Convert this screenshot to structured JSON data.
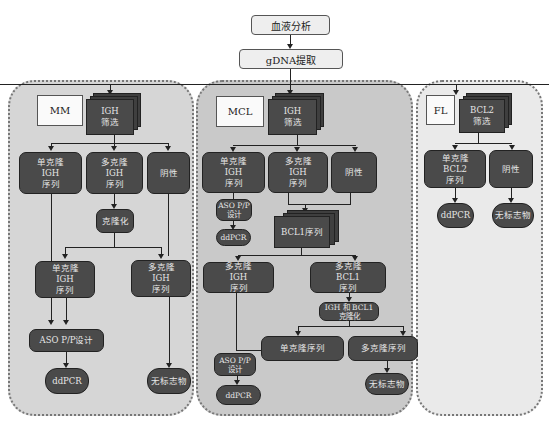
{
  "top": {
    "blood_analysis": "血液分析",
    "gdna_extraction": "gDNA提取"
  },
  "panels": {
    "mm": {
      "label": "MM",
      "screen": "IGH\n筛选",
      "mono": "单克隆\nIGH\n序列",
      "poly": "多克隆\nIGH\n序列",
      "neg": "阴性",
      "cloning": "克隆化",
      "mono2": "单克隆\nIGH\n序列",
      "poly2": "多克隆\nIGH\n序列",
      "aso": "ASO P/P设计",
      "ddpcr": "ddPCR",
      "no_marker": "无标志物"
    },
    "mcl": {
      "label": "MCL",
      "screen": "IGH\n筛选",
      "mono": "单克隆\nIGH\n序列",
      "poly": "多克隆\nIGH\n序列",
      "neg": "阴性",
      "aso_top": "ASO P/P\n设计",
      "ddpcr_top": "ddPCR",
      "bcl1_seq": "BCL1序列",
      "poly_igh": "多克隆\nIGH\n序列",
      "poly_bcl1": "多克隆\nBCL1\n序列",
      "igh_bcl1_cloning": "IGH 和 BCL1\n克隆化",
      "mono_seq": "单克隆序列",
      "poly_seq": "多克隆序列",
      "aso_bottom": "ASO P/P\n设计",
      "ddpcr_bottom": "ddPCR",
      "no_marker": "无标志物"
    },
    "fl": {
      "label": "FL",
      "screen": "BCL2\n筛选",
      "mono": "单克隆\nBCL2\n序列",
      "neg": "阴性",
      "ddpcr": "ddPCR",
      "no_marker": "无标志物"
    }
  },
  "colors": {
    "node_fill": "#4a4a4a",
    "node_text": "#e6e6e6",
    "panel_mm": "#d6d6d6",
    "panel_mcl": "#c9c9c9",
    "panel_fl": "#eaeaea"
  }
}
